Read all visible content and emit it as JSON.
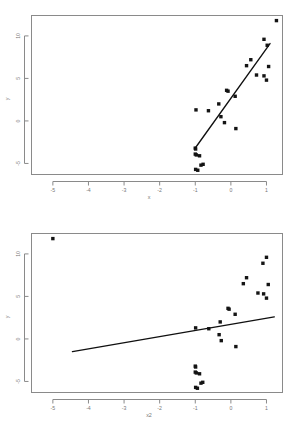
{
  "figure": {
    "kind": "two-panel-scatter-with-regression-line",
    "panel_count": 2
  },
  "chart_data": [
    {
      "id": "panel-top",
      "type": "scatter",
      "title": "",
      "xlabel": "x",
      "ylabel": "y",
      "xlim": [
        -5.6,
        1.45
      ],
      "ylim": [
        -6.3,
        12.4
      ],
      "xticks": [
        -5,
        -4,
        -3,
        -2,
        -1,
        0,
        1
      ],
      "xticklabels": [
        "-5",
        "-4",
        "-3",
        "-2",
        "-1",
        "0",
        "1"
      ],
      "yticks": [
        -5,
        0,
        5,
        10
      ],
      "yticklabels": [
        "-5",
        "0",
        "5",
        "10"
      ],
      "grid": false,
      "legend": null,
      "marker": "filled-square",
      "points": [
        {
          "x": 1.28,
          "y": 11.8
        },
        {
          "x": 0.93,
          "y": 9.6
        },
        {
          "x": 1.02,
          "y": 8.9
        },
        {
          "x": 0.56,
          "y": 7.2
        },
        {
          "x": 0.44,
          "y": 6.5
        },
        {
          "x": 1.06,
          "y": 6.4
        },
        {
          "x": 0.72,
          "y": 5.4
        },
        {
          "x": 0.93,
          "y": 5.3
        },
        {
          "x": 1.0,
          "y": 4.8
        },
        {
          "x": -0.12,
          "y": 3.6
        },
        {
          "x": -0.08,
          "y": 3.5
        },
        {
          "x": 0.12,
          "y": 2.9
        },
        {
          "x": -0.34,
          "y": 2.0
        },
        {
          "x": -0.98,
          "y": 1.3
        },
        {
          "x": -0.63,
          "y": 1.2
        },
        {
          "x": -0.28,
          "y": 0.5
        },
        {
          "x": -0.18,
          "y": -0.2
        },
        {
          "x": 0.14,
          "y": -0.9
        },
        {
          "x": -1.0,
          "y": -3.2
        },
        {
          "x": -0.99,
          "y": -3.3
        },
        {
          "x": -1.0,
          "y": -3.9
        },
        {
          "x": -0.97,
          "y": -4.0
        },
        {
          "x": -0.88,
          "y": -4.1
        },
        {
          "x": -0.84,
          "y": -5.2
        },
        {
          "x": -0.78,
          "y": -5.1
        },
        {
          "x": -0.99,
          "y": -5.7
        },
        {
          "x": -0.93,
          "y": -5.8
        }
      ],
      "fit_line": {
        "x_start": -1.02,
        "y_start": -3.3,
        "x_end": 1.1,
        "y_end": 9.1
      }
    },
    {
      "id": "panel-bottom",
      "type": "scatter",
      "title": "",
      "xlabel": "x2",
      "ylabel": "y",
      "xlim": [
        -5.6,
        1.45
      ],
      "ylim": [
        -6.3,
        12.4
      ],
      "xticks": [
        -5,
        -4,
        -3,
        -2,
        -1,
        0,
        1
      ],
      "xticklabels": [
        "-5",
        "-4",
        "-3",
        "-2",
        "-1",
        "0",
        "1"
      ],
      "yticks": [
        -5,
        0,
        5,
        10
      ],
      "yticklabels": [
        "-5",
        "0",
        "5",
        "10"
      ],
      "grid": false,
      "legend": null,
      "marker": "filled-square",
      "points": [
        {
          "x": -5.0,
          "y": 11.8
        },
        {
          "x": 1.0,
          "y": 9.6
        },
        {
          "x": 0.9,
          "y": 8.9
        },
        {
          "x": 0.44,
          "y": 7.2
        },
        {
          "x": 0.35,
          "y": 6.5
        },
        {
          "x": 1.05,
          "y": 6.4
        },
        {
          "x": 0.76,
          "y": 5.4
        },
        {
          "x": 0.92,
          "y": 5.3
        },
        {
          "x": 1.0,
          "y": 4.8
        },
        {
          "x": -0.08,
          "y": 3.6
        },
        {
          "x": -0.05,
          "y": 3.5
        },
        {
          "x": 0.12,
          "y": 2.9
        },
        {
          "x": -0.3,
          "y": 2.0
        },
        {
          "x": -0.99,
          "y": 1.3
        },
        {
          "x": -0.62,
          "y": 1.2
        },
        {
          "x": -0.33,
          "y": 0.5
        },
        {
          "x": -0.27,
          "y": -0.2
        },
        {
          "x": 0.14,
          "y": -0.9
        },
        {
          "x": -1.0,
          "y": -3.2
        },
        {
          "x": -0.99,
          "y": -3.3
        },
        {
          "x": -1.0,
          "y": -3.9
        },
        {
          "x": -0.97,
          "y": -4.0
        },
        {
          "x": -0.88,
          "y": -4.1
        },
        {
          "x": -0.84,
          "y": -5.2
        },
        {
          "x": -0.79,
          "y": -5.1
        },
        {
          "x": -0.99,
          "y": -5.7
        },
        {
          "x": -0.94,
          "y": -5.8
        }
      ],
      "fit_line": {
        "x_start": -4.45,
        "y_start": -1.5,
        "x_end": 1.22,
        "y_end": 2.6
      }
    }
  ]
}
